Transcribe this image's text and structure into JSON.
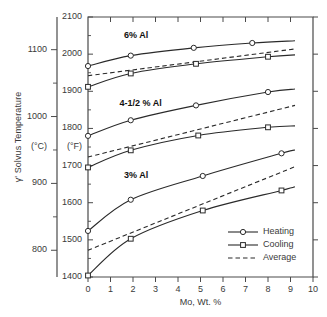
{
  "chart_data": {
    "type": "line",
    "title": "",
    "xlabel": "Mo, Wt. %",
    "ylabel": "γ' Solvus Temperature",
    "y_unit_primary": "(°F)",
    "y_unit_secondary": "(°C)",
    "xlim": [
      0,
      10
    ],
    "ylim_f": [
      1400,
      2100
    ],
    "ylim_c": [
      760,
      1149
    ],
    "grid": false,
    "legend_position": "bottom-right",
    "x_ticks": [
      "0",
      "1",
      "2",
      "3",
      "4",
      "5",
      "6",
      "7",
      "8",
      "9",
      "10"
    ],
    "y_ticks_f": [
      "1400",
      "1500",
      "1600",
      "1700",
      "1800",
      "1900",
      "2000",
      "2100"
    ],
    "y_ticks_c": [
      "800",
      "900",
      "1000",
      "1100"
    ],
    "legend": [
      {
        "label": "Heating",
        "marker": "circle",
        "line": "solid"
      },
      {
        "label": "Cooling",
        "marker": "square",
        "line": "solid"
      },
      {
        "label": "Average",
        "marker": "none",
        "line": "dashed"
      }
    ],
    "annotations": [
      {
        "text": "6% Al",
        "x": 1.6,
        "y_f": 2048
      },
      {
        "text": "4-1/2 % Al",
        "x": 1.4,
        "y_f": 1866
      },
      {
        "text": "3% Al",
        "x": 1.6,
        "y_f": 1672
      }
    ],
    "groups": [
      {
        "name": "6% Al",
        "series": [
          {
            "name": "Heating",
            "marker": "circle",
            "line": "solid",
            "x": [
              0.0,
              1.9,
              4.7,
              7.3
            ],
            "y_f": [
              1968,
              1996,
              2017,
              2030
            ],
            "x_end": 9.2,
            "y_f_end": 2036
          },
          {
            "name": "Average",
            "marker": "none",
            "line": "dashed",
            "x": [
              0.0,
              9.2
            ],
            "y_f": [
              1942,
              2014
            ]
          },
          {
            "name": "Cooling",
            "marker": "square",
            "line": "solid",
            "x": [
              0.0,
              1.9,
              4.8,
              8.0
            ],
            "y_f": [
              1912,
              1948,
              1974,
              1993
            ],
            "x_end": 9.2,
            "y_f_end": 1998
          }
        ]
      },
      {
        "name": "4-1/2 % Al",
        "series": [
          {
            "name": "Heating",
            "marker": "circle",
            "line": "solid",
            "x": [
              0.0,
              1.9,
              4.8,
              8.0
            ],
            "y_f": [
              1780,
              1822,
              1862,
              1898
            ],
            "x_end": 9.2,
            "y_f_end": 1906
          },
          {
            "name": "Average",
            "marker": "none",
            "line": "dashed",
            "x": [
              0.0,
              9.2
            ],
            "y_f": [
              1723,
              1862
            ]
          },
          {
            "name": "Cooling",
            "marker": "square",
            "line": "solid",
            "x": [
              0.0,
              1.9,
              4.9,
              8.0
            ],
            "y_f": [
              1695,
              1741,
              1781,
              1803
            ],
            "x_end": 9.2,
            "y_f_end": 1807
          }
        ]
      },
      {
        "name": "3% Al",
        "series": [
          {
            "name": "Heating",
            "marker": "circle",
            "line": "solid",
            "x": [
              0.0,
              1.9,
              5.1,
              8.6
            ],
            "y_f": [
              1524,
              1608,
              1672,
              1733
            ],
            "x_end": 9.2,
            "y_f_end": 1742
          },
          {
            "name": "Average",
            "marker": "none",
            "line": "dashed",
            "x": [
              0.0,
              9.2
            ],
            "y_f": [
              1472,
              1697
            ]
          },
          {
            "name": "Cooling",
            "marker": "square",
            "line": "solid",
            "x": [
              0.0,
              1.9,
              5.1,
              8.6
            ],
            "y_f": [
              1404,
              1503,
              1579,
              1633
            ],
            "x_end": 9.2,
            "y_f_end": 1643
          }
        ]
      }
    ]
  }
}
